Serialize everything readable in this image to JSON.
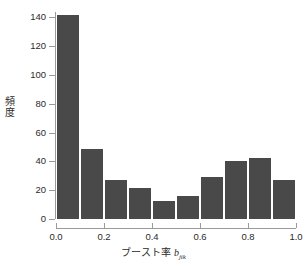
{
  "chart_data": {
    "type": "bar",
    "title": "",
    "subtitle": "",
    "xlabel_parts": {
      "text": "ブースト率 ",
      "variable": "b",
      "subscript": "jik"
    },
    "xlabel": "ブースト率 b_jik",
    "ylabel": "頻度",
    "ylabel_chars": [
      "頻",
      "度"
    ],
    "categories": [
      "0.0–0.1",
      "0.1–0.2",
      "0.2–0.3",
      "0.3–0.4",
      "0.4–0.5",
      "0.5–0.6",
      "0.6–0.7",
      "0.7–0.8",
      "0.8–0.9",
      "0.9–1.0"
    ],
    "bin_edges": [
      0.0,
      0.1,
      0.2,
      0.3,
      0.4,
      0.5,
      0.6,
      0.7,
      0.8,
      0.9,
      1.0
    ],
    "values": [
      142,
      49,
      28,
      22,
      13,
      17,
      30,
      41,
      43,
      28
    ],
    "xlim": [
      0.0,
      1.0
    ],
    "ylim": [
      0,
      145
    ],
    "yticks": [
      0,
      20,
      40,
      60,
      80,
      100,
      120,
      140
    ],
    "ytick_labels": [
      "0",
      "20",
      "40",
      "60",
      "80",
      "100",
      "120",
      "140"
    ],
    "xticks": [
      0.0,
      0.2,
      0.4,
      0.6,
      0.8,
      1.0
    ],
    "xtick_labels": [
      "0.0",
      "0.2",
      "0.4",
      "0.6",
      "0.8",
      "1.0"
    ],
    "grid": false,
    "legend": false,
    "bar_color": "#494949",
    "axis_color": "#9a9a9a",
    "text_color": "#2b2b2b",
    "background": "#ffffff"
  },
  "figure": {
    "top_fragment": ""
  }
}
